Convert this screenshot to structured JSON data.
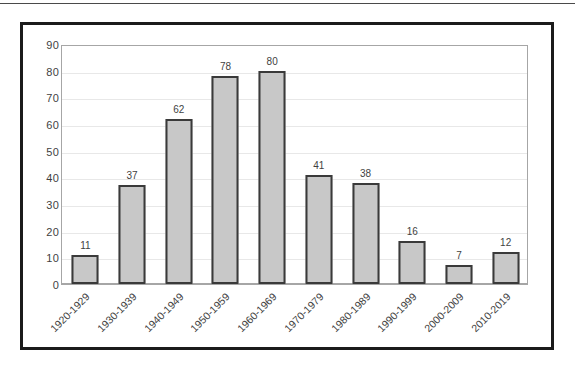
{
  "chart_data": {
    "type": "bar",
    "title": "",
    "subtitle": "",
    "xlabel": "",
    "ylabel": "",
    "categories": [
      "1920-1929",
      "1930-1939",
      "1940-1949",
      "1950-1959",
      "1960-1969",
      "1970-1979",
      "1980-1989",
      "1990-1999",
      "2000-2009",
      "2010-2019"
    ],
    "values": [
      11,
      37,
      62,
      78,
      80,
      41,
      38,
      16,
      7,
      12
    ],
    "data_labels": [
      "11",
      "37",
      "62",
      "78",
      "80",
      "41",
      "38",
      "16",
      "7",
      "12"
    ],
    "ylim": [
      0,
      90
    ],
    "ytick_step": 10,
    "ytick_labels": [
      "90",
      "80",
      "70",
      "60",
      "50",
      "40",
      "30",
      "20",
      "10",
      "0"
    ],
    "grid": "horizontal",
    "legend": "none",
    "legend_position": "none",
    "series": [
      {
        "name": "",
        "values": [
          11,
          37,
          62,
          78,
          80,
          41,
          38,
          16,
          7,
          12
        ]
      }
    ]
  },
  "style": {
    "bar_fill": "#c8c8c8",
    "bar_border": "#3a3a3a",
    "gridline_color": "#e8e8e8",
    "axis_color": "#a6a6a6",
    "text_color": "#3f3f3f",
    "frame_color": "#1b1b1b",
    "background": "#ffffff"
  }
}
